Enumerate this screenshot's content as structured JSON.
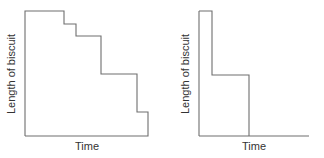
{
  "chart_data": [
    {
      "type": "line",
      "title": "",
      "xlabel": "Time",
      "ylabel": "Length of biscuit",
      "step": true,
      "grid": false,
      "description": "Biscuit length decreases in four unequal steps over time (several bites)",
      "points": [
        {
          "x": 0,
          "y": 100
        },
        {
          "x": 31,
          "y": 100
        },
        {
          "x": 31,
          "y": 90
        },
        {
          "x": 41,
          "y": 90
        },
        {
          "x": 41,
          "y": 80
        },
        {
          "x": 62,
          "y": 80
        },
        {
          "x": 62,
          "y": 50
        },
        {
          "x": 91,
          "y": 50
        },
        {
          "x": 91,
          "y": 19
        },
        {
          "x": 100,
          "y": 19
        },
        {
          "x": 100,
          "y": 0
        }
      ],
      "path_px": "M25,136 L25,11 L64,11 L64,24 L76,24 L76,36 L101,36 L101,74 L137,74 L137,112 L148,112 L148,136 L25,136",
      "axes_px": {
        "x0": 25,
        "x1": 148,
        "y_bottom": 136,
        "y_top": 11
      },
      "xlabel_px": {
        "x": 87,
        "y": 150
      },
      "ylabel_px": {
        "x": 12,
        "y": 74
      }
    },
    {
      "type": "line",
      "title": "",
      "xlabel": "Time",
      "ylabel": "Length of biscuit",
      "step": true,
      "grid": false,
      "description": "Biscuit length drops sharply, holds, then drops to zero (two bites)",
      "points": [
        {
          "x": 0,
          "y": 100
        },
        {
          "x": 12,
          "y": 100
        },
        {
          "x": 12,
          "y": 49
        },
        {
          "x": 46,
          "y": 49
        },
        {
          "x": 46,
          "y": 0
        },
        {
          "x": 100,
          "y": 0
        }
      ],
      "path_px": "M199,11 L212,11 L212,75 L249,75 L249,136",
      "axes_px": {
        "x0": 199,
        "x1": 309,
        "y_bottom": 136,
        "y_top": 11
      },
      "xlabel_px": {
        "x": 254,
        "y": 150
      },
      "ylabel_px": {
        "x": 186,
        "y": 74
      }
    }
  ],
  "labels": {
    "left_x": "Time",
    "left_y": "Length of biscuit",
    "right_x": "Time",
    "right_y": "Length of biscuit"
  },
  "colors": {
    "line": "#6e6e6e",
    "text": "#333333"
  }
}
